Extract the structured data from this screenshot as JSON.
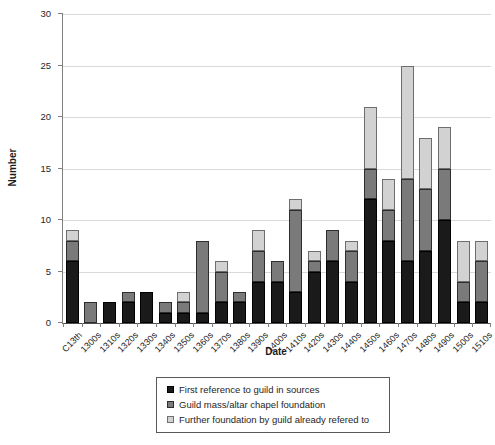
{
  "chart_data": {
    "type": "bar",
    "stacked": true,
    "xlabel": "Date",
    "ylabel": "Number",
    "ylim": [
      0,
      30
    ],
    "ytick_interval": 5,
    "yticks": [
      0,
      5,
      10,
      15,
      20,
      25,
      30
    ],
    "grid": true,
    "legend_position": "bottom",
    "categories": [
      "C13th",
      "1300s",
      "1310s",
      "1320s",
      "1330s",
      "1340s",
      "1350s",
      "1360s",
      "1370s",
      "1380s",
      "1390s",
      "1400s",
      "1410s",
      "1420s",
      "1430s",
      "1440s",
      "1450s",
      "1460s",
      "1470s",
      "1480s",
      "1490s",
      "1500s",
      "1510s"
    ],
    "series": [
      {
        "name": "First reference to guild in sources",
        "color": "#1a1a1a",
        "border": "#000000",
        "values": [
          6,
          0,
          2,
          2,
          3,
          1,
          1,
          1,
          2,
          2,
          4,
          4,
          3,
          5,
          6,
          4,
          12,
          8,
          6,
          7,
          10,
          2,
          2
        ]
      },
      {
        "name": "Guild mass/altar chapel foundation",
        "color": "#7a7a7a",
        "border": "#2e2e2e",
        "values": [
          2,
          2,
          0,
          1,
          0,
          1,
          1,
          7,
          3,
          1,
          3,
          2,
          8,
          1,
          3,
          3,
          3,
          3,
          8,
          6,
          5,
          2,
          4
        ]
      },
      {
        "name": "Further foundation by guild already refered to",
        "color": "#d2d2d2",
        "border": "#6e6e6e",
        "values": [
          1,
          0,
          0,
          0,
          0,
          0,
          1,
          0,
          1,
          0,
          2,
          0,
          1,
          1,
          0,
          1,
          6,
          3,
          11,
          5,
          4,
          4,
          2
        ]
      }
    ],
    "colors": {
      "grid": "#d9d9d9",
      "axis": "#7f7f7f",
      "text": "#262626"
    }
  }
}
